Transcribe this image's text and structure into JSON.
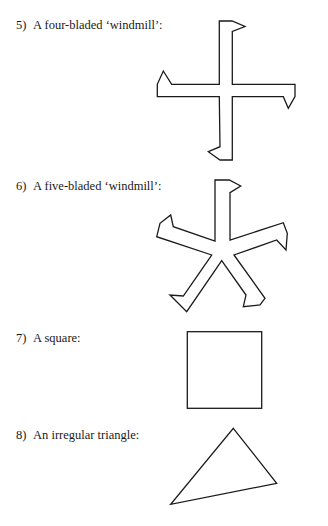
{
  "items": [
    {
      "number": "5)",
      "label": "A four-bladed ‘windmill’:",
      "shape": "four-bladed-windmill"
    },
    {
      "number": "6)",
      "label": "A five-bladed ‘windmill’:",
      "shape": "five-bladed-windmill"
    },
    {
      "number": "7)",
      "label": "A square:",
      "shape": "square"
    },
    {
      "number": "8)",
      "label": "An irregular triangle:",
      "shape": "irregular-triangle"
    }
  ],
  "colors": {
    "stroke": "#1a1a1a",
    "background": "#ffffff"
  }
}
